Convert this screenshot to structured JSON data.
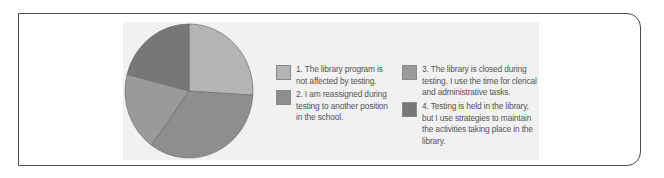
{
  "chart_data": {
    "type": "pie",
    "title": "",
    "categories": [
      "1. The library program is not affected by testing.",
      "2. I am reassigned during testing to another position in the school.",
      "3. The library is closed during testing. I use the time for clerical and administrative tasks.",
      "4. Testing is held in the library, but I use strategies to maintain the activities taking place in the library."
    ],
    "values": [
      26,
      34,
      19,
      21
    ],
    "colors": [
      "#b4b4b4",
      "#8e8e8e",
      "#9a9a9a",
      "#777777"
    ],
    "start_angle_deg": 0,
    "direction": "clockwise",
    "legend_position": "right",
    "legend_columns": 2
  },
  "legend": {
    "items": [
      {
        "label": "1. The library program is not affected by testing.",
        "color": "#b4b4b4"
      },
      {
        "label": "2. I am reassigned during testing to another position in the school.",
        "color": "#8e8e8e"
      },
      {
        "label": "3. The library is closed during testing. I use the time for clerical and administrative tasks.",
        "color": "#9a9a9a"
      },
      {
        "label": "4. Testing is held in the library, but I use strategies to maintain the activities taking place in the library.",
        "color": "#777777"
      }
    ]
  }
}
